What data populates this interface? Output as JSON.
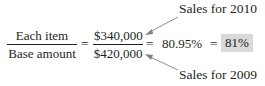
{
  "formula": {
    "left_fraction": {
      "numerator": "Each item",
      "denominator": "Base amount"
    },
    "equals_1": "=",
    "right_fraction": {
      "numerator": "$340,000",
      "denominator": "$420,000"
    },
    "equals_2": "=",
    "value": "80.95%",
    "equals_3": "=",
    "result": "81%",
    "result_highlight_color": "#d9d9d9"
  },
  "annotations": {
    "top": "Sales for 2010",
    "bottom": "Sales for 2009"
  }
}
